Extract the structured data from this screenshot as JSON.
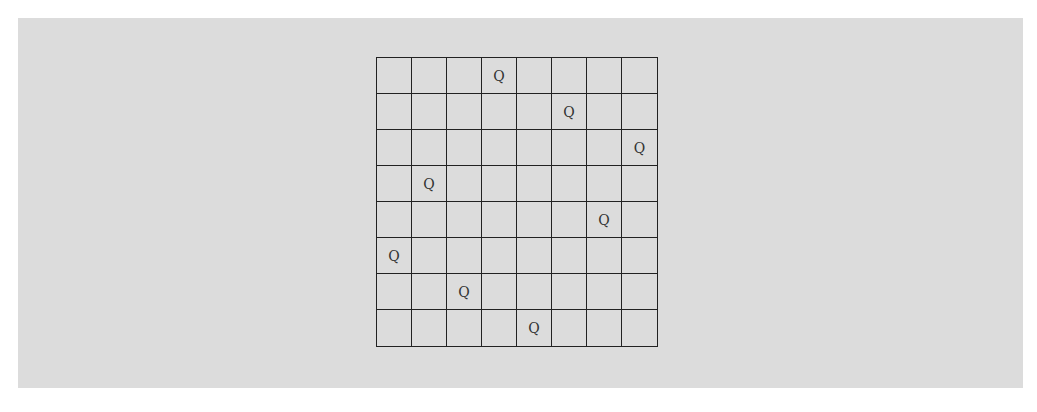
{
  "board": {
    "size": 8,
    "piece_symbol": "Q",
    "queens_by_row": [
      3,
      5,
      7,
      1,
      6,
      0,
      2,
      4
    ],
    "line_color": "#222222",
    "background": "#dcdcdc"
  }
}
